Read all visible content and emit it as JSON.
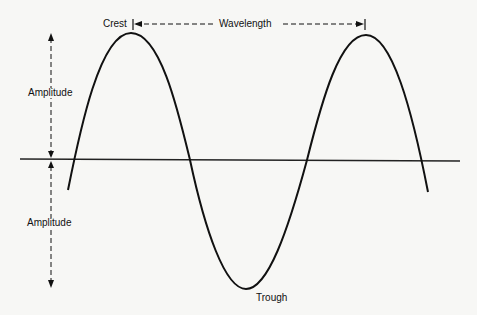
{
  "diagram": {
    "labels": {
      "crest": "Crest",
      "wavelength": "Wavelength",
      "amplitude_upper": "Amplitude",
      "amplitude_lower": "Amplitude",
      "trough": "Trough"
    },
    "colors": {
      "stroke": "#111111",
      "background": "#f7f7f5"
    },
    "geometry": {
      "axis": {
        "x1": 20,
        "y1": 159,
        "x2": 460,
        "y2": 161
      },
      "crest1": {
        "x": 131,
        "y": 33
      },
      "crest2": {
        "x": 366,
        "y": 35
      },
      "trough": {
        "x": 246,
        "y": 289
      },
      "amplitude_arrow_x": 51
    }
  }
}
